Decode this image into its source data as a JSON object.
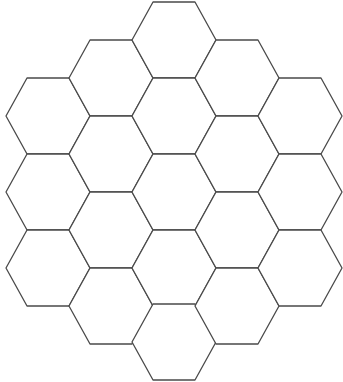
{
  "diagram": {
    "type": "hexagonal-grid",
    "orientation": "flat-top",
    "cell_count": 19,
    "rings": 2,
    "column_counts": [
      3,
      4,
      5,
      4,
      3
    ],
    "hex": {
      "radius": 42,
      "half_height": 38
    },
    "column_centers_x": [
      48,
      111,
      174,
      237,
      300
    ],
    "columns": [
      {
        "centers_y": [
          116,
          192,
          268
        ]
      },
      {
        "centers_y": [
          78,
          154,
          230,
          306
        ]
      },
      {
        "centers_y": [
          40,
          116,
          192,
          268,
          342
        ]
      },
      {
        "centers_y": [
          78,
          154,
          230,
          306
        ]
      },
      {
        "centers_y": [
          116,
          192,
          268
        ]
      }
    ],
    "colors": {
      "stroke": "#4a4a4a",
      "fill": "#ffffff",
      "background": "#ffffff"
    }
  }
}
